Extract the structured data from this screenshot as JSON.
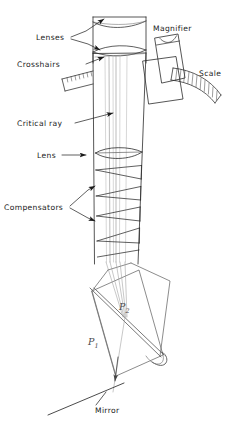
{
  "figure": {
    "background_color": "#ffffff",
    "line_color": "#2b2b2b",
    "light_line_color": "#9a9a9a",
    "ray_color": "#8d8d8d",
    "label_color": "#1a1a1a",
    "prism_label_color": "#4a4a4a"
  },
  "labels": {
    "lenses": "Lenses",
    "crosshairs": "Crosshairs",
    "critical_ray": "Critical ray",
    "lens": "Lens",
    "compensators": "Compensators",
    "magnifier": "Magnifier",
    "scale": "Scale",
    "mirror": "Mirror",
    "prism_1": "P",
    "prism_1_sub": "1",
    "prism_2": "P",
    "prism_2_sub": "2"
  },
  "components": [
    {
      "name": "eyepiece-lenses",
      "label": "Lenses",
      "count": 2
    },
    {
      "name": "crosshairs",
      "label": "Crosshairs"
    },
    {
      "name": "critical-ray",
      "label": "Critical ray"
    },
    {
      "name": "objective-lens",
      "label": "Lens"
    },
    {
      "name": "compensators",
      "label": "Compensators",
      "count": 4
    },
    {
      "name": "magnifier",
      "label": "Magnifier"
    },
    {
      "name": "scale",
      "label": "Scale"
    },
    {
      "name": "prism-p1",
      "label": "P1"
    },
    {
      "name": "prism-p2",
      "label": "P2"
    },
    {
      "name": "mirror",
      "label": "Mirror"
    }
  ]
}
